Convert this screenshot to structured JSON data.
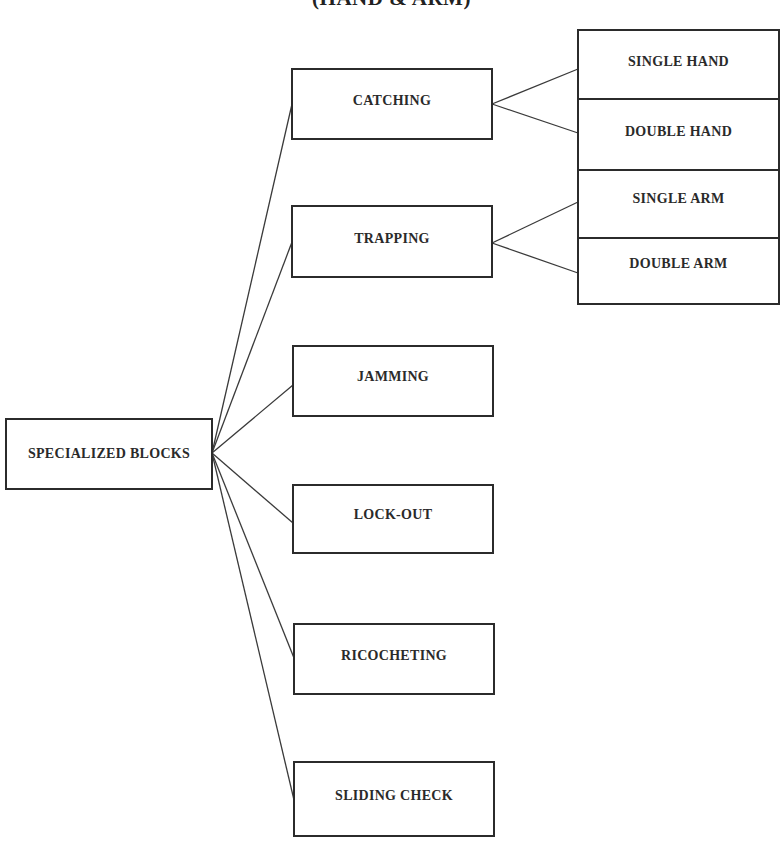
{
  "title": "(HAND & ARM)",
  "root": {
    "label": "SPECIALIZED BLOCKS"
  },
  "branches": [
    {
      "label": "CATCHING",
      "children": [
        "SINGLE HAND",
        "DOUBLE HAND"
      ]
    },
    {
      "label": "TRAPPING",
      "children": [
        "SINGLE ARM",
        "DOUBLE ARM"
      ]
    },
    {
      "label": "JAMMING",
      "children": []
    },
    {
      "label": "LOCK-OUT",
      "children": []
    },
    {
      "label": "RICOCHETING",
      "children": []
    },
    {
      "label": "SLIDING CHECK",
      "children": []
    }
  ],
  "leaves": {
    "single_hand": "SINGLE HAND",
    "double_hand": "DOUBLE HAND",
    "single_arm": "SINGLE ARM",
    "double_arm": "DOUBLE ARM"
  },
  "colors": {
    "line": "#2b2b2b",
    "text": "#2a2a2a",
    "background": "#ffffff"
  }
}
